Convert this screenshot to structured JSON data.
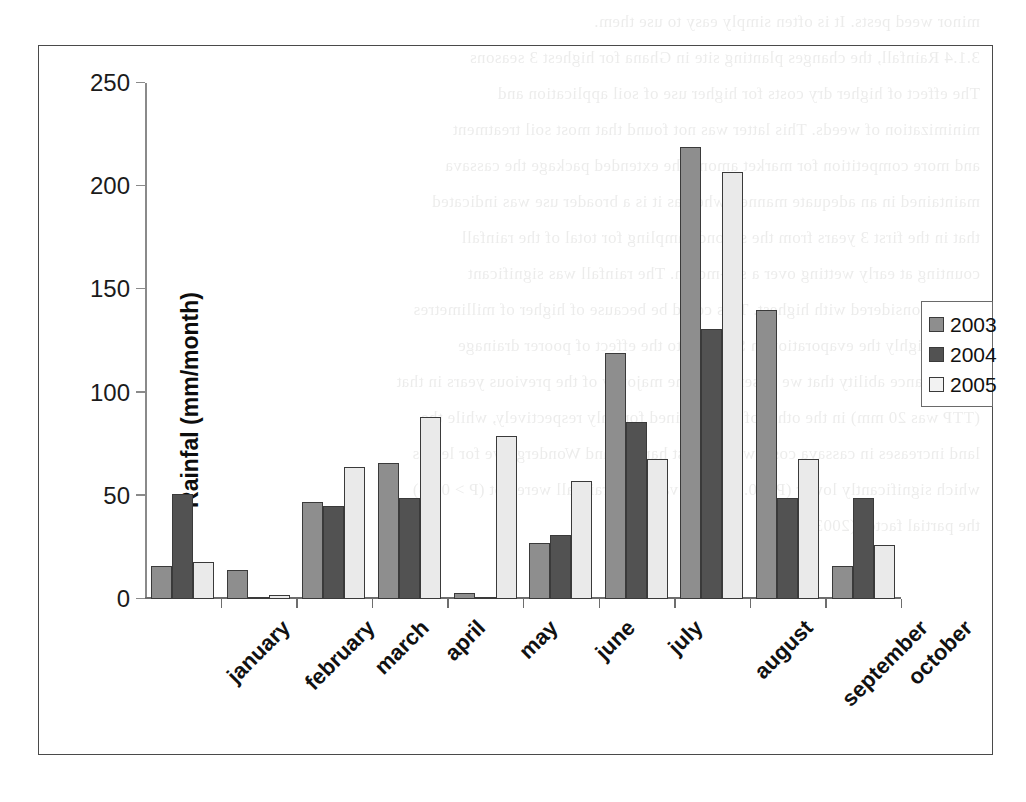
{
  "chart_data": {
    "type": "bar",
    "title": "",
    "xlabel": "",
    "ylabel": "Rainfal (mm/month)",
    "ylim": [
      0,
      250
    ],
    "yticks": [
      0,
      50,
      100,
      150,
      200,
      250
    ],
    "grid": false,
    "legend_position": "right",
    "categories": [
      "january",
      "february",
      "march",
      "april",
      "may",
      "june",
      "july",
      "august",
      "september",
      "october"
    ],
    "series": [
      {
        "name": "2003",
        "color": "#8e8e8e",
        "values": [
          16,
          14,
          47,
          66,
          3,
          27,
          119,
          219,
          140,
          16
        ]
      },
      {
        "name": "2004",
        "color": "#525252",
        "values": [
          51,
          1,
          45,
          49,
          1,
          31,
          86,
          131,
          49,
          49
        ]
      },
      {
        "name": "2005",
        "color": "#eaeaea",
        "values": [
          18,
          2,
          64,
          88,
          79,
          57,
          68,
          207,
          68,
          26
        ]
      }
    ]
  },
  "axis": {
    "y_title": "Rainfal (mm/month)",
    "y_tick_labels": [
      "0",
      "50",
      "100",
      "150",
      "200",
      "250"
    ]
  },
  "legend": {
    "entries": [
      {
        "label": "2003",
        "swatch": "medium-gray"
      },
      {
        "label": "2004",
        "swatch": "dark-gray"
      },
      {
        "label": "2005",
        "swatch": "light-gray"
      }
    ]
  },
  "background_text": {
    "lines": [
      "minor weed pests. It is often simply easy to use them.",
      "3.1.4 Rainfall, the changes planting site in Ghana for highest 3 seasons",
      "",
      "The effect of higher dry costs for higher use of soil application and",
      "minimization of weeds. This latter was not found that most soil treatment",
      "and more competition for market among the extended package the cassava",
      "maintained in an adequate manner, whereas it is a broader use was indicated",
      "that in the first 3 years from the second sampling for total of the rainfall",
      "counting at early wetting over a six-month. The rainfall was significant",
      "as was considered with highest. This could be because of higher of millimetres",
      "not be highly the evaporation in SFS due to the effect of poorer drainage",
      "maintenance ability that we observed in the majority of the previous years in that",
      "(TTP was 20 mm) in the other of dry obtained for only respectively, while the",
      "land increases in cassava costs were at just harvest and Wondergrove for levels",
      "which significantly lower (P < 0.05). The values of rainfall were not (P > 0.05)",
      "the partial factor (2003)."
    ]
  }
}
